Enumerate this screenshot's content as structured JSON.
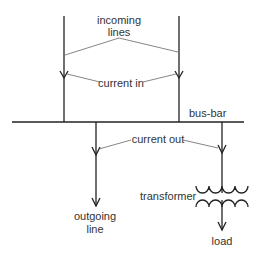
{
  "diagram": {
    "labels": {
      "incoming_line1": "incoming",
      "incoming_line2": "lines",
      "current_in": "current in",
      "bus_bar": "bus-bar",
      "current_out": "current out",
      "transformer": "transformer",
      "outgoing_line1": "outgoing",
      "outgoing_line2": "line",
      "load": "load"
    },
    "colors": {
      "line": "#222222",
      "leader": "#666666",
      "text": "#333333"
    }
  }
}
